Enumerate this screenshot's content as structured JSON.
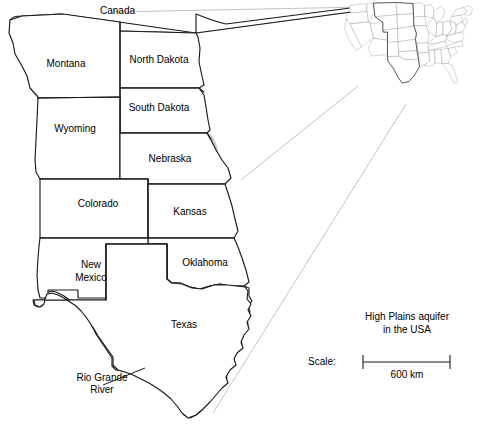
{
  "figure": {
    "kind": "map",
    "title_line1": "High Plains aquifer",
    "title_line2": "in the USA",
    "background_color": "#ffffff",
    "line_color": "#1a1a1a",
    "aquifer_fill_color": "#c9c9c9",
    "leader_line_color": "#b4b4b4"
  },
  "labels": {
    "canada": "Canada",
    "rio_grande_line1": "Rio Grande",
    "rio_grande_line2": "River"
  },
  "states": [
    {
      "id": "montana",
      "name": "Montana",
      "label_x": 66,
      "label_y": 67,
      "aquifer": false
    },
    {
      "id": "north-dakota",
      "name": "North Dakota",
      "label_x": 159,
      "label_y": 63,
      "aquifer": false
    },
    {
      "id": "south-dakota",
      "name": "South Dakota",
      "label_x": 159,
      "label_y": 111,
      "aquifer": true
    },
    {
      "id": "wyoming",
      "name": "Wyoming",
      "label_x": 75,
      "label_y": 132,
      "aquifer": true
    },
    {
      "id": "nebraska",
      "name": "Nebraska",
      "label_x": 168,
      "label_y": 159,
      "aquifer": true
    },
    {
      "id": "colorado",
      "name": "Colorado",
      "label_x": 98,
      "label_y": 204,
      "aquifer": true
    },
    {
      "id": "kansas",
      "name": "Kansas",
      "label_x": 188,
      "label_y": 213,
      "aquifer": true
    },
    {
      "id": "new-mexico",
      "name": "New\nMexico",
      "name_line1": "New",
      "name_line2": "Mexico",
      "label_x": 91,
      "label_y": 269,
      "aquifer": true
    },
    {
      "id": "oklahoma",
      "name": "Oklahoma",
      "label_x": 204,
      "label_y": 263,
      "aquifer": true
    },
    {
      "id": "texas",
      "name": "Texas",
      "label_x": 183,
      "label_y": 325,
      "aquifer": true
    }
  ],
  "scale": {
    "label": "Scale:",
    "value": "600 km",
    "bar_start_x": 363,
    "bar_end_x": 450,
    "bar_y": 362
  },
  "inset": {
    "description": "continental-usa-with-high-plains-states-outlined",
    "highlighted_states": [
      "Montana",
      "North Dakota",
      "South Dakota",
      "Wyoming",
      "Nebraska",
      "Colorado",
      "Kansas",
      "Oklahoma",
      "New Mexico",
      "Texas"
    ]
  }
}
